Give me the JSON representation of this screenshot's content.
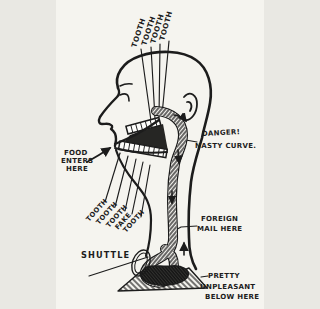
{
  "colors": {
    "ink": "#1c1c1c",
    "paper": "#f5f4ef",
    "teeth_fill": "#fdfdfb"
  },
  "labels": {
    "top_teeth": [
      "TOOTH",
      "TOOTH",
      "TOOTH",
      "TOOTH"
    ],
    "food_lines": [
      "FOOD",
      "ENTERS",
      "HERE"
    ],
    "danger_lines": [
      "DANGER!",
      "NASTY CURVE."
    ],
    "lower_teeth": [
      "TOOTH",
      "TOOTH",
      "TOOTH",
      "FAKE",
      "TOOTH"
    ],
    "shuttle": "SHUTTLE",
    "foreign_lines": [
      "FOREIGN",
      "MAIL HERE"
    ],
    "unpleasant_lines": [
      "PRETTY",
      "UNPLEASANT",
      "BELOW HERE"
    ]
  },
  "arrows": [
    {
      "name": "food-entry-arrow",
      "direction": "up-right"
    },
    {
      "name": "gullet-curve-arrow",
      "direction": "down-right"
    },
    {
      "name": "flow-down-arrow-1",
      "direction": "down"
    },
    {
      "name": "flow-down-arrow-2",
      "direction": "down"
    },
    {
      "name": "flow-up-arrow",
      "direction": "up"
    }
  ]
}
